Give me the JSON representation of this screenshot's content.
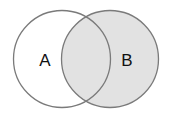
{
  "diagram": {
    "type": "venn",
    "sets": [
      {
        "id": "A",
        "label": "A",
        "shaded": false
      },
      {
        "id": "B",
        "label": "B",
        "shaded": true
      }
    ],
    "shaded_region": "B",
    "colors": {
      "background": "#ffffff",
      "shade": "#e2e2e2",
      "stroke": "#7a7a7a",
      "text": "#111111"
    }
  }
}
